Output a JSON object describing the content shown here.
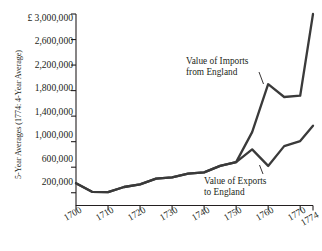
{
  "chart_data": {
    "type": "line",
    "title": "",
    "subtitle": "",
    "xlabel": "",
    "ylabel": "5-Year Averages (1774: 4-Year Average)",
    "currency_symbol": "£",
    "xlim": [
      1700,
      1774
    ],
    "ylim": [
      0,
      3000000
    ],
    "grid": false,
    "legend_position": "inline-annotations",
    "x_ticks": [
      1700,
      1710,
      1720,
      1730,
      1740,
      1750,
      1760,
      1770,
      1774
    ],
    "x_tick_labels": [
      "1700",
      "1710",
      "1720",
      "1730",
      "1740",
      "1750",
      "1760",
      "1770",
      "1774"
    ],
    "y_ticks": [
      200000,
      600000,
      1000000,
      1400000,
      1800000,
      2200000,
      2600000,
      3000000
    ],
    "y_tick_labels": [
      "200,000",
      "600,000",
      "1,000,000",
      "1,400,000",
      "1,800,000",
      "2,200,000",
      "2,600,000",
      "£ 3,000,000"
    ],
    "x": [
      1700,
      1705,
      1710,
      1715,
      1720,
      1725,
      1730,
      1735,
      1740,
      1745,
      1750,
      1755,
      1760,
      1765,
      1770,
      1774
    ],
    "series": [
      {
        "name": "Value of Imports from England",
        "label": "Value of Imports\nfrom England",
        "color": "#3a3a3a",
        "values": [
          350000,
          215000,
          210000,
          290000,
          330000,
          420000,
          440000,
          500000,
          520000,
          620000,
          680000,
          1150000,
          1900000,
          1700000,
          1720000,
          3000000
        ]
      },
      {
        "name": "Value of Exports to England",
        "label": "Value of Exports\nto England",
        "color": "#3a3a3a",
        "values": [
          350000,
          215000,
          210000,
          290000,
          330000,
          420000,
          440000,
          500000,
          520000,
          620000,
          680000,
          880000,
          620000,
          930000,
          1010000,
          1250000
        ]
      }
    ],
    "annotations": [
      {
        "id": "imports",
        "line1": "Value of Imports",
        "line2": "from England",
        "target_x": 1760,
        "target_y": 1900000
      },
      {
        "id": "exports",
        "line1": "Value of Exports",
        "line2": "to England",
        "target_x": 1760,
        "target_y": 620000
      }
    ]
  }
}
